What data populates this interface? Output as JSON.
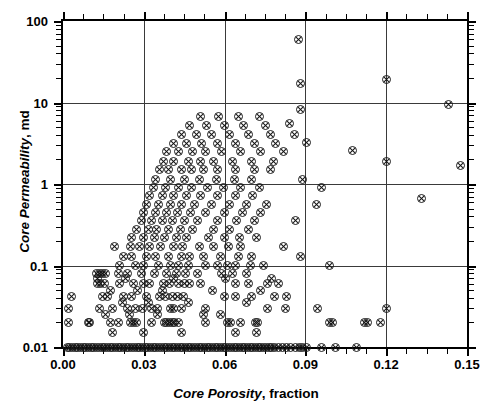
{
  "chart_data": {
    "type": "scatter",
    "title": "",
    "xlabel_italic": "Core Porosity",
    "xlabel_rest": ", fraction",
    "ylabel_italic": "Core Permeability",
    "ylabel_rest": ", md",
    "xlim": [
      0.0,
      0.15
    ],
    "ylim": [
      0.01,
      100
    ],
    "yscale": "log",
    "xscale": "linear",
    "grid": true,
    "legend": null,
    "x_ticks": [
      "0.00",
      "0.03",
      "0.06",
      "0.09",
      "0.12",
      "0.15"
    ],
    "x_tick_values": [
      0.0,
      0.03,
      0.06,
      0.09,
      0.12,
      0.15
    ],
    "y_ticks": [
      "0.01",
      "0.1",
      "1",
      "10",
      "100"
    ],
    "y_tick_values": [
      0.01,
      0.1,
      1,
      10,
      100
    ],
    "marker": "circle-with-x",
    "marker_color": "#111111",
    "grid_color": "#3a3a3a",
    "axis_color": "#000000",
    "n_points": 352,
    "points": [
      [
        0.0015,
        0.01
      ],
      [
        0.0025,
        0.01
      ],
      [
        0.0035,
        0.01
      ],
      [
        0.0045,
        0.01
      ],
      [
        0.0055,
        0.01
      ],
      [
        0.0065,
        0.01
      ],
      [
        0.0075,
        0.01
      ],
      [
        0.0085,
        0.01
      ],
      [
        0.0095,
        0.01
      ],
      [
        0.0105,
        0.01
      ],
      [
        0.0115,
        0.01
      ],
      [
        0.0125,
        0.01
      ],
      [
        0.0135,
        0.01
      ],
      [
        0.0145,
        0.01
      ],
      [
        0.0155,
        0.01
      ],
      [
        0.0165,
        0.01
      ],
      [
        0.0175,
        0.01
      ],
      [
        0.0185,
        0.01
      ],
      [
        0.0195,
        0.01
      ],
      [
        0.0205,
        0.01
      ],
      [
        0.0215,
        0.01
      ],
      [
        0.0225,
        0.01
      ],
      [
        0.0235,
        0.01
      ],
      [
        0.0245,
        0.01
      ],
      [
        0.0255,
        0.01
      ],
      [
        0.0265,
        0.01
      ],
      [
        0.0275,
        0.01
      ],
      [
        0.0285,
        0.01
      ],
      [
        0.0295,
        0.01
      ],
      [
        0.0305,
        0.01
      ],
      [
        0.0315,
        0.01
      ],
      [
        0.0325,
        0.01
      ],
      [
        0.0335,
        0.01
      ],
      [
        0.0345,
        0.01
      ],
      [
        0.0355,
        0.01
      ],
      [
        0.0365,
        0.01
      ],
      [
        0.0375,
        0.01
      ],
      [
        0.0385,
        0.01
      ],
      [
        0.0395,
        0.01
      ],
      [
        0.0405,
        0.01
      ],
      [
        0.0415,
        0.01
      ],
      [
        0.0425,
        0.01
      ],
      [
        0.0435,
        0.01
      ],
      [
        0.0445,
        0.01
      ],
      [
        0.0455,
        0.01
      ],
      [
        0.0465,
        0.01
      ],
      [
        0.0475,
        0.01
      ],
      [
        0.0485,
        0.01
      ],
      [
        0.0495,
        0.01
      ],
      [
        0.0505,
        0.01
      ],
      [
        0.0515,
        0.01
      ],
      [
        0.0525,
        0.01
      ],
      [
        0.0535,
        0.01
      ],
      [
        0.0545,
        0.01
      ],
      [
        0.0555,
        0.01
      ],
      [
        0.0565,
        0.01
      ],
      [
        0.0575,
        0.01
      ],
      [
        0.0585,
        0.01
      ],
      [
        0.0595,
        0.01
      ],
      [
        0.0605,
        0.01
      ],
      [
        0.0615,
        0.01
      ],
      [
        0.0625,
        0.01
      ],
      [
        0.0635,
        0.01
      ],
      [
        0.0645,
        0.01
      ],
      [
        0.0655,
        0.01
      ],
      [
        0.0665,
        0.01
      ],
      [
        0.0675,
        0.01
      ],
      [
        0.0685,
        0.01
      ],
      [
        0.0695,
        0.01
      ],
      [
        0.0705,
        0.01
      ],
      [
        0.0715,
        0.01
      ],
      [
        0.0725,
        0.01
      ],
      [
        0.0735,
        0.01
      ],
      [
        0.0745,
        0.01
      ],
      [
        0.0755,
        0.01
      ],
      [
        0.0765,
        0.01
      ],
      [
        0.0775,
        0.01
      ],
      [
        0.0785,
        0.01
      ],
      [
        0.08,
        0.01
      ],
      [
        0.0815,
        0.01
      ],
      [
        0.083,
        0.01
      ],
      [
        0.0845,
        0.01
      ],
      [
        0.0862,
        0.01
      ],
      [
        0.0878,
        0.01
      ],
      [
        0.089,
        0.01
      ],
      [
        0.0905,
        0.01
      ],
      [
        0.096,
        0.01
      ],
      [
        0.101,
        0.01
      ],
      [
        0.109,
        0.01
      ],
      [
        0.002,
        0.02
      ],
      [
        0.0095,
        0.02
      ],
      [
        0.01,
        0.02
      ],
      [
        0.0175,
        0.02
      ],
      [
        0.0205,
        0.02
      ],
      [
        0.025,
        0.02
      ],
      [
        0.0262,
        0.02
      ],
      [
        0.0272,
        0.02
      ],
      [
        0.033,
        0.02
      ],
      [
        0.0375,
        0.02
      ],
      [
        0.0385,
        0.02
      ],
      [
        0.0395,
        0.02
      ],
      [
        0.0405,
        0.02
      ],
      [
        0.0415,
        0.02
      ],
      [
        0.043,
        0.02
      ],
      [
        0.053,
        0.02
      ],
      [
        0.061,
        0.02
      ],
      [
        0.0622,
        0.02
      ],
      [
        0.066,
        0.02
      ],
      [
        0.0715,
        0.02
      ],
      [
        0.0723,
        0.02
      ],
      [
        0.099,
        0.02
      ],
      [
        0.1,
        0.02
      ],
      [
        0.112,
        0.02
      ],
      [
        0.1132,
        0.02
      ],
      [
        0.118,
        0.02
      ],
      [
        0.0022,
        0.03
      ],
      [
        0.0135,
        0.03
      ],
      [
        0.0185,
        0.03
      ],
      [
        0.024,
        0.03
      ],
      [
        0.0268,
        0.03
      ],
      [
        0.0295,
        0.03
      ],
      [
        0.033,
        0.03
      ],
      [
        0.035,
        0.03
      ],
      [
        0.04,
        0.03
      ],
      [
        0.0412,
        0.03
      ],
      [
        0.044,
        0.03
      ],
      [
        0.053,
        0.03
      ],
      [
        0.076,
        0.03
      ],
      [
        0.0825,
        0.03
      ],
      [
        0.0945,
        0.03
      ],
      [
        0.12,
        0.03
      ],
      [
        0.003,
        0.042
      ],
      [
        0.0145,
        0.042
      ],
      [
        0.0165,
        0.042
      ],
      [
        0.0225,
        0.042
      ],
      [
        0.0255,
        0.042
      ],
      [
        0.031,
        0.042
      ],
      [
        0.036,
        0.042
      ],
      [
        0.0382,
        0.042
      ],
      [
        0.0405,
        0.042
      ],
      [
        0.0425,
        0.042
      ],
      [
        0.0447,
        0.042
      ],
      [
        0.06,
        0.042
      ],
      [
        0.064,
        0.042
      ],
      [
        0.07,
        0.042
      ],
      [
        0.0785,
        0.042
      ],
      [
        0.083,
        0.042
      ],
      [
        0.0128,
        0.06
      ],
      [
        0.014,
        0.06
      ],
      [
        0.0155,
        0.06
      ],
      [
        0.021,
        0.06
      ],
      [
        0.0262,
        0.06
      ],
      [
        0.03,
        0.06
      ],
      [
        0.032,
        0.06
      ],
      [
        0.0372,
        0.06
      ],
      [
        0.0395,
        0.06
      ],
      [
        0.043,
        0.06
      ],
      [
        0.0452,
        0.06
      ],
      [
        0.047,
        0.06
      ],
      [
        0.051,
        0.06
      ],
      [
        0.064,
        0.06
      ],
      [
        0.069,
        0.06
      ],
      [
        0.076,
        0.06
      ],
      [
        0.08,
        0.06
      ],
      [
        0.0125,
        0.08
      ],
      [
        0.0135,
        0.08
      ],
      [
        0.0148,
        0.08
      ],
      [
        0.0158,
        0.08
      ],
      [
        0.0205,
        0.08
      ],
      [
        0.024,
        0.08
      ],
      [
        0.029,
        0.08
      ],
      [
        0.034,
        0.08
      ],
      [
        0.0385,
        0.08
      ],
      [
        0.042,
        0.08
      ],
      [
        0.0455,
        0.08
      ],
      [
        0.05,
        0.08
      ],
      [
        0.059,
        0.08
      ],
      [
        0.063,
        0.08
      ],
      [
        0.068,
        0.08
      ],
      [
        0.021,
        0.1
      ],
      [
        0.027,
        0.1
      ],
      [
        0.03,
        0.1
      ],
      [
        0.0355,
        0.1
      ],
      [
        0.04,
        0.1
      ],
      [
        0.043,
        0.1
      ],
      [
        0.0465,
        0.1
      ],
      [
        0.053,
        0.1
      ],
      [
        0.0575,
        0.1
      ],
      [
        0.061,
        0.1
      ],
      [
        0.064,
        0.1
      ],
      [
        0.0695,
        0.1
      ],
      [
        0.0745,
        0.1
      ],
      [
        0.099,
        0.1
      ],
      [
        0.0225,
        0.13
      ],
      [
        0.0255,
        0.13
      ],
      [
        0.031,
        0.13
      ],
      [
        0.0345,
        0.13
      ],
      [
        0.039,
        0.13
      ],
      [
        0.044,
        0.13
      ],
      [
        0.047,
        0.13
      ],
      [
        0.052,
        0.13
      ],
      [
        0.0585,
        0.13
      ],
      [
        0.065,
        0.13
      ],
      [
        0.07,
        0.13
      ],
      [
        0.088,
        0.13
      ],
      [
        0.019,
        0.17
      ],
      [
        0.025,
        0.17
      ],
      [
        0.0285,
        0.17
      ],
      [
        0.032,
        0.17
      ],
      [
        0.0362,
        0.17
      ],
      [
        0.041,
        0.17
      ],
      [
        0.0445,
        0.17
      ],
      [
        0.0505,
        0.17
      ],
      [
        0.056,
        0.17
      ],
      [
        0.0615,
        0.17
      ],
      [
        0.066,
        0.17
      ],
      [
        0.082,
        0.17
      ],
      [
        0.0255,
        0.22
      ],
      [
        0.03,
        0.22
      ],
      [
        0.0338,
        0.22
      ],
      [
        0.0375,
        0.22
      ],
      [
        0.042,
        0.22
      ],
      [
        0.046,
        0.22
      ],
      [
        0.054,
        0.22
      ],
      [
        0.06,
        0.22
      ],
      [
        0.0655,
        0.22
      ],
      [
        0.072,
        0.22
      ],
      [
        0.0272,
        0.28
      ],
      [
        0.0318,
        0.28
      ],
      [
        0.0348,
        0.28
      ],
      [
        0.0392,
        0.28
      ],
      [
        0.0435,
        0.28
      ],
      [
        0.048,
        0.28
      ],
      [
        0.056,
        0.28
      ],
      [
        0.062,
        0.28
      ],
      [
        0.0688,
        0.28
      ],
      [
        0.029,
        0.36
      ],
      [
        0.033,
        0.36
      ],
      [
        0.0368,
        0.36
      ],
      [
        0.0405,
        0.36
      ],
      [
        0.045,
        0.36
      ],
      [
        0.05,
        0.36
      ],
      [
        0.0575,
        0.36
      ],
      [
        0.0645,
        0.36
      ],
      [
        0.071,
        0.36
      ],
      [
        0.0865,
        0.36
      ],
      [
        0.03,
        0.45
      ],
      [
        0.0345,
        0.45
      ],
      [
        0.0385,
        0.45
      ],
      [
        0.0425,
        0.45
      ],
      [
        0.0472,
        0.45
      ],
      [
        0.053,
        0.45
      ],
      [
        0.06,
        0.45
      ],
      [
        0.0665,
        0.45
      ],
      [
        0.0735,
        0.45
      ],
      [
        0.031,
        0.56
      ],
      [
        0.0355,
        0.56
      ],
      [
        0.0398,
        0.56
      ],
      [
        0.044,
        0.56
      ],
      [
        0.049,
        0.56
      ],
      [
        0.055,
        0.56
      ],
      [
        0.0618,
        0.56
      ],
      [
        0.0682,
        0.56
      ],
      [
        0.0755,
        0.56
      ],
      [
        0.094,
        0.56
      ],
      [
        0.133,
        0.67
      ],
      [
        0.0322,
        0.72
      ],
      [
        0.0368,
        0.72
      ],
      [
        0.0412,
        0.72
      ],
      [
        0.0458,
        0.72
      ],
      [
        0.0512,
        0.72
      ],
      [
        0.0572,
        0.72
      ],
      [
        0.064,
        0.72
      ],
      [
        0.0705,
        0.72
      ],
      [
        0.0335,
        0.9
      ],
      [
        0.038,
        0.9
      ],
      [
        0.0428,
        0.9
      ],
      [
        0.0478,
        0.9
      ],
      [
        0.0535,
        0.9
      ],
      [
        0.0595,
        0.9
      ],
      [
        0.066,
        0.9
      ],
      [
        0.073,
        0.9
      ],
      [
        0.096,
        0.9
      ],
      [
        0.0345,
        1.15
      ],
      [
        0.04,
        1.15
      ],
      [
        0.0452,
        1.15
      ],
      [
        0.0508,
        1.15
      ],
      [
        0.057,
        1.15
      ],
      [
        0.0635,
        1.15
      ],
      [
        0.07,
        1.15
      ],
      [
        0.089,
        1.15
      ],
      [
        0.0358,
        1.5
      ],
      [
        0.0392,
        1.5
      ],
      [
        0.044,
        1.5
      ],
      [
        0.0478,
        1.5
      ],
      [
        0.052,
        1.5
      ],
      [
        0.0575,
        1.5
      ],
      [
        0.064,
        1.5
      ],
      [
        0.071,
        1.5
      ],
      [
        0.077,
        1.5
      ],
      [
        0.1475,
        1.7
      ],
      [
        0.0372,
        1.9
      ],
      [
        0.0412,
        1.9
      ],
      [
        0.0465,
        1.9
      ],
      [
        0.051,
        1.9
      ],
      [
        0.056,
        1.9
      ],
      [
        0.0628,
        1.9
      ],
      [
        0.07,
        1.9
      ],
      [
        0.078,
        1.9
      ],
      [
        0.12,
        1.9
      ],
      [
        0.0385,
        2.5
      ],
      [
        0.043,
        2.5
      ],
      [
        0.048,
        2.5
      ],
      [
        0.053,
        2.5
      ],
      [
        0.059,
        2.5
      ],
      [
        0.066,
        2.5
      ],
      [
        0.0735,
        2.5
      ],
      [
        0.082,
        2.5
      ],
      [
        0.1075,
        2.6
      ],
      [
        0.041,
        3.1
      ],
      [
        0.046,
        3.1
      ],
      [
        0.0515,
        3.1
      ],
      [
        0.0572,
        3.1
      ],
      [
        0.064,
        3.1
      ],
      [
        0.0712,
        3.1
      ],
      [
        0.079,
        3.1
      ],
      [
        0.0905,
        3.2
      ],
      [
        0.044,
        4.0
      ],
      [
        0.0495,
        4.0
      ],
      [
        0.0552,
        4.0
      ],
      [
        0.062,
        4.0
      ],
      [
        0.069,
        4.0
      ],
      [
        0.077,
        4.0
      ],
      [
        0.086,
        4.0
      ],
      [
        0.047,
        5.2
      ],
      [
        0.0532,
        5.2
      ],
      [
        0.0598,
        5.2
      ],
      [
        0.067,
        5.2
      ],
      [
        0.0752,
        5.2
      ],
      [
        0.084,
        5.6
      ],
      [
        0.051,
        6.8
      ],
      [
        0.0578,
        6.8
      ],
      [
        0.065,
        6.8
      ],
      [
        0.073,
        6.8
      ],
      [
        0.088,
        8.2
      ],
      [
        0.143,
        9.5
      ],
      [
        0.088,
        17.0
      ],
      [
        0.12,
        19.0
      ],
      [
        0.0875,
        60.0
      ],
      [
        0.064,
        0.015
      ],
      [
        0.072,
        0.015
      ],
      [
        0.03,
        0.015
      ],
      [
        0.0185,
        0.015
      ],
      [
        0.044,
        0.015
      ],
      [
        0.052,
        0.025
      ],
      [
        0.0585,
        0.025
      ],
      [
        0.0248,
        0.025
      ],
      [
        0.0352,
        0.025
      ],
      [
        0.0158,
        0.025
      ],
      [
        0.0465,
        0.035
      ],
      [
        0.068,
        0.035
      ],
      [
        0.0222,
        0.035
      ],
      [
        0.0318,
        0.035
      ],
      [
        0.0555,
        0.05
      ],
      [
        0.0735,
        0.05
      ],
      [
        0.0278,
        0.05
      ],
      [
        0.0368,
        0.05
      ],
      [
        0.0175,
        0.05
      ],
      [
        0.0605,
        0.07
      ],
      [
        0.0775,
        0.07
      ],
      [
        0.0232,
        0.07
      ],
      [
        0.0412,
        0.07
      ],
      [
        0.0128,
        0.07
      ]
    ]
  },
  "axes": {
    "x_title_italic": "Core Porosity",
    "x_title_plain": ", fraction",
    "y_title_italic": "Core Permeability",
    "y_title_plain": ", md"
  }
}
